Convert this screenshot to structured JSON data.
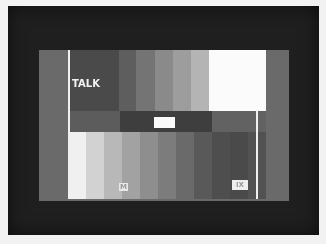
{
  "image": {
    "description": "Photograph of a CRT monitor displaying a grayscale test pattern",
    "colors": {
      "border": "#f2f2f2",
      "bezel": "#1f1f1f",
      "screen_background": "#6a6a6a"
    }
  },
  "screen": {
    "top_band": [
      {
        "width": 49,
        "color": "#4a4a4a"
      },
      {
        "width": 17,
        "color": "#5e5e5e"
      },
      {
        "width": 19,
        "color": "#747474"
      },
      {
        "width": 18,
        "color": "#8a8a8a"
      },
      {
        "width": 18,
        "color": "#9d9d9d"
      },
      {
        "width": 18,
        "color": "#b4b4b4"
      },
      {
        "width": 57,
        "color": "#fbfbfb"
      }
    ],
    "mid_band": [
      {
        "width": 50,
        "color": "#5c5c5c"
      },
      {
        "width": 92,
        "color": "#3e3e3e"
      },
      {
        "width": 54,
        "color": "#626262"
      }
    ],
    "low_band": [
      {
        "width": 18,
        "color": "#f0f0f0"
      },
      {
        "width": 18,
        "color": "#d2d2d2"
      },
      {
        "width": 18,
        "color": "#b8b8b8"
      },
      {
        "width": 18,
        "color": "#a2a2a2"
      },
      {
        "width": 18,
        "color": "#8e8e8e"
      },
      {
        "width": 18,
        "color": "#7c7c7c"
      },
      {
        "width": 18,
        "color": "#6a6a6a"
      },
      {
        "width": 18,
        "color": "#595959"
      },
      {
        "width": 18,
        "color": "#4e4e4e"
      },
      {
        "width": 18,
        "color": "#4a4a4a"
      },
      {
        "width": 18,
        "color": "#525252"
      }
    ],
    "labels": {
      "talk": "TALK",
      "one": "1",
      "m": "M",
      "box": "IX"
    }
  }
}
